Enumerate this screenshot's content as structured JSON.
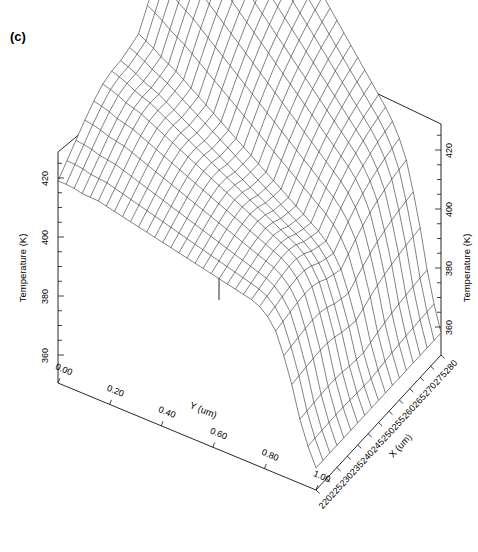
{
  "figure": {
    "panel_label": "(c)",
    "background_color": "#ffffff",
    "line_color": "#1a1a1a"
  },
  "chart_data": {
    "type": "surface",
    "title": "",
    "subtitle": "",
    "panel": "(c)",
    "xlabel": "X (um)",
    "ylabel": "Y (um)",
    "zlabel": "Temperature (K)",
    "zlabel_right": "Temperature (K)",
    "xlim": [
      220,
      280
    ],
    "ylim": [
      0.0,
      1.0
    ],
    "zlim": [
      350,
      430
    ],
    "xticks": [
      220,
      225,
      230,
      235,
      240,
      245,
      250,
      255,
      260,
      265,
      270,
      275,
      280
    ],
    "xticklabels": [
      "220",
      "225",
      "230",
      "235",
      "240",
      "245",
      "250",
      "255",
      "260",
      "265",
      "270",
      "275",
      "280"
    ],
    "yticks": [
      0.0,
      0.2,
      0.4,
      0.6,
      0.8,
      1.0
    ],
    "yticklabels": [
      "0.00",
      "0.20",
      "0.40",
      "0.60",
      "0.80",
      "1.00"
    ],
    "zticks": [
      360,
      380,
      400,
      420
    ],
    "zticklabels": [
      "360",
      "380",
      "400",
      "420"
    ],
    "grid": false,
    "legend": "none",
    "colormap": "none",
    "shading": "wireframe",
    "view": {
      "azimuth": -52,
      "elevation": 22
    },
    "mesh_counts": {
      "nx": 33,
      "ny": 19
    },
    "surface_description": "Temperature plateau near 420 K over most of the X range, a shallow trough and ridge near the centre, with a steep drop to about 358 K at the X = 280 edge.",
    "x_profile_x": [
      220,
      223,
      226,
      229,
      232,
      235,
      238,
      241,
      244,
      247,
      250,
      253,
      256,
      259,
      262,
      265,
      268,
      271,
      274,
      277,
      280
    ],
    "x_profile_z": [
      419,
      419,
      418,
      418,
      417,
      416,
      415,
      414,
      413,
      412,
      411,
      410,
      409,
      408,
      407,
      406,
      404,
      398,
      385,
      368,
      358
    ],
    "y_profile_y": [
      0.0,
      0.1,
      0.2,
      0.3,
      0.4,
      0.5,
      0.6,
      0.7,
      0.8,
      0.9,
      1.0
    ],
    "y_profile_z": [
      421,
      421,
      420,
      418,
      414,
      409,
      413,
      419,
      421,
      421,
      421
    ],
    "z_values_note": "z = base(x) + ridge(y); base falls from 419 K at X=220 to 358 K at X=280 with the sharp fall beginning near X=268; ridge(y) is a trough of about -12 K centred at Y=0.47 flanked by plateaus near 421 K."
  }
}
